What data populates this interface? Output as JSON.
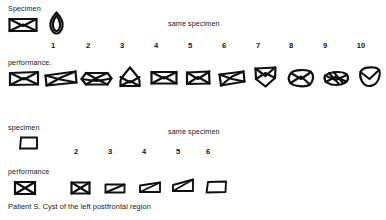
{
  "figure": {
    "caption": "Patient S.   Cyst of the left postfrontal region",
    "caption_patient": "Patient S.",
    "caption_lesion": "Cyst of the left postfrontal region"
  },
  "sections": [
    {
      "id": "upper-trial-series",
      "specimen_label": "Specimen",
      "same_specimen_label": "same specimen",
      "performance_label": "performance.",
      "specimen_glyphs": [
        {
          "name": "specimen-envelope",
          "icon": "envelope-crossed"
        },
        {
          "name": "specimen-leaf",
          "icon": "leaf-diamond"
        }
      ],
      "trial_numbers": [
        "1",
        "2",
        "3",
        "4",
        "5",
        "6",
        "7",
        "8",
        "9",
        "10"
      ],
      "performance_glyphs": [
        {
          "trial": "1",
          "name": "drawing-trial-1",
          "icon": "envelope-crossed-neat"
        },
        {
          "trial": "2",
          "name": "drawing-trial-2",
          "icon": "envelope-slanted-wide"
        },
        {
          "trial": "3",
          "name": "drawing-trial-3",
          "icon": "envelope-pointed-sides"
        },
        {
          "trial": "4",
          "name": "drawing-trial-4",
          "icon": "envelope-peaked-top"
        },
        {
          "trial": "5",
          "name": "drawing-trial-5",
          "icon": "envelope-crossed-neat"
        },
        {
          "trial": "6",
          "name": "drawing-trial-6",
          "icon": "envelope-crossed-small"
        },
        {
          "trial": "7",
          "name": "drawing-trial-7",
          "icon": "envelope-tilted"
        },
        {
          "trial": "8",
          "name": "drawing-trial-8",
          "icon": "envelope-pointed-bottom"
        },
        {
          "trial": "9",
          "name": "drawing-trial-9",
          "icon": "envelope-rounded-distorted"
        },
        {
          "trial": "10",
          "name": "drawing-trial-10",
          "icon": "envelope-scribbled"
        },
        {
          "trial": "11",
          "name": "drawing-trial-11",
          "icon": "envelope-leaf-outline"
        }
      ]
    },
    {
      "id": "lower-trial-series",
      "specimen_label": "specimen",
      "same_specimen_label": "same specimen",
      "performance_label": "performance",
      "specimen_glyphs": [
        {
          "name": "specimen-open-box",
          "icon": "open-box-trapezoid"
        }
      ],
      "trial_numbers": [
        "2",
        "3",
        "4",
        "5",
        "6"
      ],
      "performance_glyphs": [
        {
          "trial": "1",
          "name": "box-drawing-trial-1",
          "icon": "box-crossed"
        },
        {
          "trial": "2",
          "name": "box-drawing-trial-2",
          "icon": "box-crossed"
        },
        {
          "trial": "3",
          "name": "box-drawing-trial-3",
          "icon": "box-single-diagonal-flat"
        },
        {
          "trial": "4",
          "name": "box-drawing-trial-4",
          "icon": "box-diagonal-step"
        },
        {
          "trial": "5",
          "name": "box-drawing-trial-5",
          "icon": "box-diagonal-tall"
        },
        {
          "trial": "6",
          "name": "box-drawing-trial-6",
          "icon": "box-open-trapezoid"
        }
      ]
    }
  ]
}
